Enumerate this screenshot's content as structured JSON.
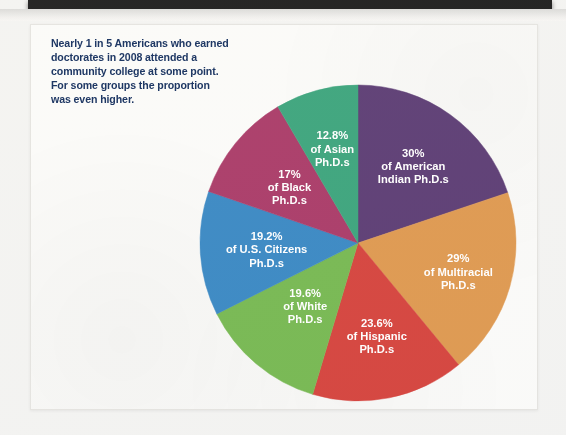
{
  "page": {
    "background_color": "#f3f3f1",
    "card_color": "#fbfbf9",
    "scanner_bar_color": "#0a0a0a"
  },
  "caption": {
    "text": "Nearly 1 in 5 Americans who earned doctorates in 2008 attended a community college at some point. For some groups the proportion was even higher.",
    "color": "#1f3864"
  },
  "chart_data": {
    "type": "pie",
    "title": "",
    "subtitle": "",
    "xlabel": "",
    "ylabel": "",
    "legend_position": "on-slice",
    "grid": false,
    "label_color": "#ffffff",
    "start_angle_deg": 0,
    "direction": "clockwise",
    "categories": [
      "American Indian Ph.D.s",
      "Multiracial Ph.D.s",
      "Hispanic Ph.D.s",
      "White Ph.D.s",
      "U.S. Citizens Ph.D.s",
      "Black Ph.D.s",
      "Asian Ph.D.s"
    ],
    "values": [
      30,
      29,
      23.6,
      19.6,
      19.2,
      17,
      12.8
    ],
    "colors": [
      "#4f2d69",
      "#dc9142",
      "#d2352e",
      "#6cb344",
      "#2a7fbf",
      "#a32b5c",
      "#2c9d72"
    ],
    "slices": [
      {
        "name": "American Indian Ph.D.s",
        "value": 30,
        "percent_label": "30%",
        "line2": "of American",
        "line3": "Indian Ph.D.s",
        "color": "#4f2d69"
      },
      {
        "name": "Multiracial Ph.D.s",
        "value": 29,
        "percent_label": "29%",
        "line2": "of Multiracial",
        "line3": "Ph.D.s",
        "color": "#dc9142"
      },
      {
        "name": "Hispanic Ph.D.s",
        "value": 23.6,
        "percent_label": "23.6%",
        "line2": "of Hispanic",
        "line3": "Ph.D.s",
        "color": "#d2352e"
      },
      {
        "name": "White Ph.D.s",
        "value": 19.6,
        "percent_label": "19.6%",
        "line2": "of White",
        "line3": "Ph.D.s",
        "color": "#6cb344"
      },
      {
        "name": "U.S. Citizens Ph.D.s",
        "value": 19.2,
        "percent_label": "19.2%",
        "line2": "of U.S. Citizens",
        "line3": "Ph.D.s",
        "color": "#2a7fbf"
      },
      {
        "name": "Black Ph.D.s",
        "value": 17,
        "percent_label": "17%",
        "line2": "of Black",
        "line3": "Ph.D.s",
        "color": "#a32b5c"
      },
      {
        "name": "Asian Ph.D.s",
        "value": 12.8,
        "percent_label": "12.8%",
        "line2": "of Asian",
        "line3": "Ph.D.s",
        "color": "#2c9d72"
      }
    ]
  }
}
